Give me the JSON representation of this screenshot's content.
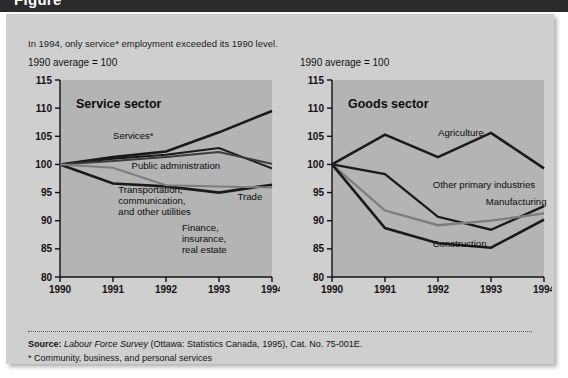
{
  "banner": {
    "title": "Figure"
  },
  "subtitle": "In 1994, only service* employment exceeded its 1990 level.",
  "axis_note_left": "1990 average = 100",
  "axis_note_right": "1990 average = 100",
  "source": {
    "label": "Source:",
    "italic": "Labour Force Survey",
    "rest": " (Ottawa: Statistics Canada, 1995), Cat. No. 75-001E.",
    "footnote": "* Community, business, and personal services"
  },
  "colors": {
    "panel": "#cfcfcf",
    "plot": "#b4b4b4",
    "dark_line": "#1a1a1a",
    "mid_line": "#3c3c3c",
    "grey_line": "#7d7d7d",
    "axis": "#111111",
    "banner": "#2b2b2b"
  },
  "chart_data": [
    {
      "type": "line",
      "title": "Service sector",
      "x": [
        1990,
        1991,
        1992,
        1993,
        1994
      ],
      "xlabel": "",
      "ylabel": "",
      "ylim": [
        80,
        115
      ],
      "yticks": [
        80,
        85,
        90,
        95,
        100,
        105,
        110,
        115
      ],
      "xticklabels": [
        "1990",
        "1991",
        "1992",
        "1993",
        "1994"
      ],
      "grid": false,
      "legend": "inline-annotations",
      "annotations": [
        {
          "label": "Services*",
          "x": 1991.0,
          "y": 104.6
        },
        {
          "label": "Public administration",
          "x": 1991.35,
          "y": 99.1
        },
        {
          "label": "Transportation, communication, and other utilities",
          "x": 1991.1,
          "y": 95.0
        },
        {
          "label": "Trade",
          "x": 1993.35,
          "y": 93.6
        },
        {
          "label": "Finance, insurance, real estate",
          "x": 1992.3,
          "y": 88.2
        }
      ],
      "series": [
        {
          "name": "Services*",
          "color": "#1a1a1a",
          "width": 2.6,
          "values": [
            100.0,
            101.3,
            102.3,
            105.7,
            109.5
          ]
        },
        {
          "name": "Public administration",
          "color": "#1a1a1a",
          "width": 2.0,
          "values": [
            100.0,
            101.0,
            101.7,
            102.9,
            99.3
          ]
        },
        {
          "name": "Finance, insurance, real estate",
          "color": "#3c3c3c",
          "width": 2.0,
          "values": [
            100.0,
            100.6,
            101.3,
            102.2,
            100.1
          ]
        },
        {
          "name": "Trade",
          "color": "#1a1a1a",
          "width": 2.6,
          "values": [
            100.0,
            96.6,
            96.1,
            95.0,
            96.4
          ]
        },
        {
          "name": "Transportation, communication, and other utilities",
          "color": "#7d7d7d",
          "width": 2.0,
          "values": [
            100.0,
            99.4,
            96.3,
            96.1,
            95.9
          ]
        }
      ]
    },
    {
      "type": "line",
      "title": "Goods sector",
      "x": [
        1990,
        1991,
        1992,
        1993,
        1994
      ],
      "xlabel": "",
      "ylabel": "",
      "ylim": [
        80,
        115
      ],
      "yticks": [
        80,
        85,
        90,
        95,
        100,
        105,
        110,
        115
      ],
      "xticklabels": [
        "1990",
        "1991",
        "1992",
        "1993",
        "1994"
      ],
      "grid": false,
      "legend": "inline-annotations",
      "annotations": [
        {
          "label": "Agriculture",
          "x": 1992.0,
          "y": 105.0
        },
        {
          "label": "Other primary industries",
          "x": 1991.9,
          "y": 95.8
        },
        {
          "label": "Manufacturing",
          "x": 1992.9,
          "y": 92.8
        },
        {
          "label": "Construction",
          "x": 1991.9,
          "y": 85.3
        }
      ],
      "series": [
        {
          "name": "Agriculture",
          "color": "#1a1a1a",
          "width": 2.6,
          "values": [
            100.0,
            105.3,
            101.3,
            105.6,
            99.3
          ]
        },
        {
          "name": "Other primary industries",
          "color": "#1a1a1a",
          "width": 2.3,
          "values": [
            100.0,
            98.3,
            90.7,
            88.4,
            92.6
          ]
        },
        {
          "name": "Manufacturing",
          "color": "#7d7d7d",
          "width": 2.3,
          "values": [
            100.0,
            91.8,
            89.2,
            90.0,
            91.3
          ]
        },
        {
          "name": "Construction",
          "color": "#1a1a1a",
          "width": 2.6,
          "values": [
            100.0,
            88.7,
            86.0,
            85.2,
            90.2
          ]
        }
      ]
    }
  ]
}
